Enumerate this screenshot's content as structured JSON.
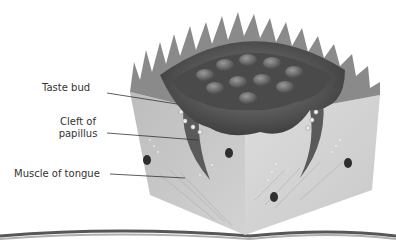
{
  "diagram": {
    "labels": [
      {
        "id": "taste-bud",
        "text": "Taste bud"
      },
      {
        "id": "cleft-of-papillus",
        "line1": "Cleft of",
        "line2": "papillus"
      },
      {
        "id": "muscle-of-tongue",
        "text": "Muscle of tongue"
      }
    ],
    "colors": {
      "background": "#ffffff",
      "block_left_face": "#c4c4c4",
      "block_right_face": "#d6d6d6",
      "papilla_dark": "#4a4a4a",
      "papilla_mid": "#6e6e6e",
      "spikes": "#8a8a8a",
      "leader_line": "#333333",
      "label_text": "#333333"
    }
  }
}
